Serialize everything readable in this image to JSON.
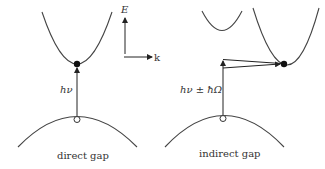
{
  "diagram": {
    "axes": {
      "energy_label": "E",
      "momentum_label": "k"
    },
    "direct": {
      "caption": "direct gap",
      "transition_label": "hν"
    },
    "indirect": {
      "caption": "indirect gap",
      "transition_label": "hν ± ħΩ"
    },
    "colors": {
      "curve": "#444444",
      "arrow": "#222222",
      "electron": "#111111",
      "text": "#333333"
    }
  }
}
